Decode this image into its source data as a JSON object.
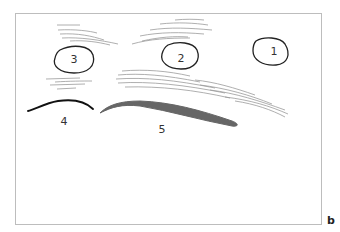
{
  "figure": {
    "panel_label": "b",
    "regions": [
      {
        "id": "1",
        "label": "1",
        "shape": "oval"
      },
      {
        "id": "2",
        "label": "2",
        "shape": "oval"
      },
      {
        "id": "3",
        "label": "3",
        "shape": "oval"
      },
      {
        "id": "4",
        "label": "4",
        "shape": "thin-curve"
      },
      {
        "id": "5",
        "label": "5",
        "shape": "thick-curve"
      }
    ],
    "colors": {
      "outline": "#222222",
      "hatch": "#999999",
      "thick_curve": "#666666",
      "frame": "#bdbdbd"
    }
  }
}
